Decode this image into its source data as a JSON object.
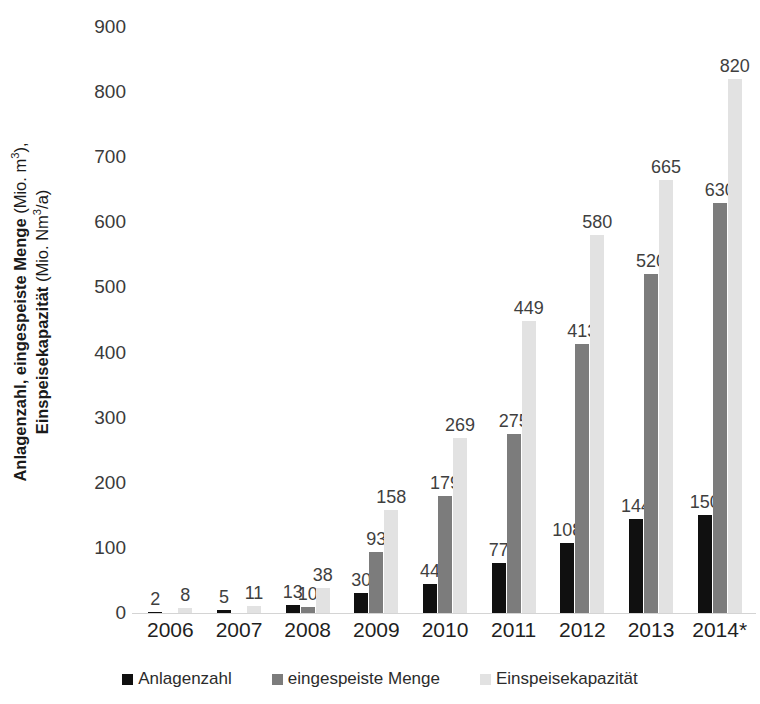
{
  "chart_data": {
    "type": "bar",
    "title": "",
    "xlabel": "",
    "ylabel_line1_bold": "Anlagenzahl, eingespeiste Menge",
    "ylabel_line1_reg": " (Mio. m",
    "ylabel_line1_sup": "3",
    "ylabel_line1_tail": "),",
    "ylabel_line2_bold": "Einspeisekapazität",
    "ylabel_line2_reg": " (Mio. Nm",
    "ylabel_line2_sup": "3",
    "ylabel_line2_tail": "/a)",
    "categories": [
      "2006",
      "2007",
      "2008",
      "2009",
      "2010",
      "2011",
      "2012",
      "2013",
      "2014*"
    ],
    "series": [
      {
        "name": "Anlagenzahl",
        "color": "#101010",
        "values": [
          2,
          5,
          13,
          30,
          44,
          77,
          108,
          144,
          150
        ]
      },
      {
        "name": "eingespeiste Menge",
        "color": "#7c7c7c",
        "values": [
          null,
          null,
          10,
          93,
          179,
          275,
          413,
          520,
          630
        ]
      },
      {
        "name": "Einspeisekapazität",
        "color": "#e2e2e2",
        "values": [
          8,
          11,
          38,
          158,
          269,
          449,
          580,
          665,
          820
        ]
      }
    ],
    "ylim": [
      0,
      900
    ],
    "yticks": [
      0,
      100,
      200,
      300,
      400,
      500,
      600,
      700,
      800,
      900
    ],
    "grid": false,
    "legend_position": "bottom"
  }
}
